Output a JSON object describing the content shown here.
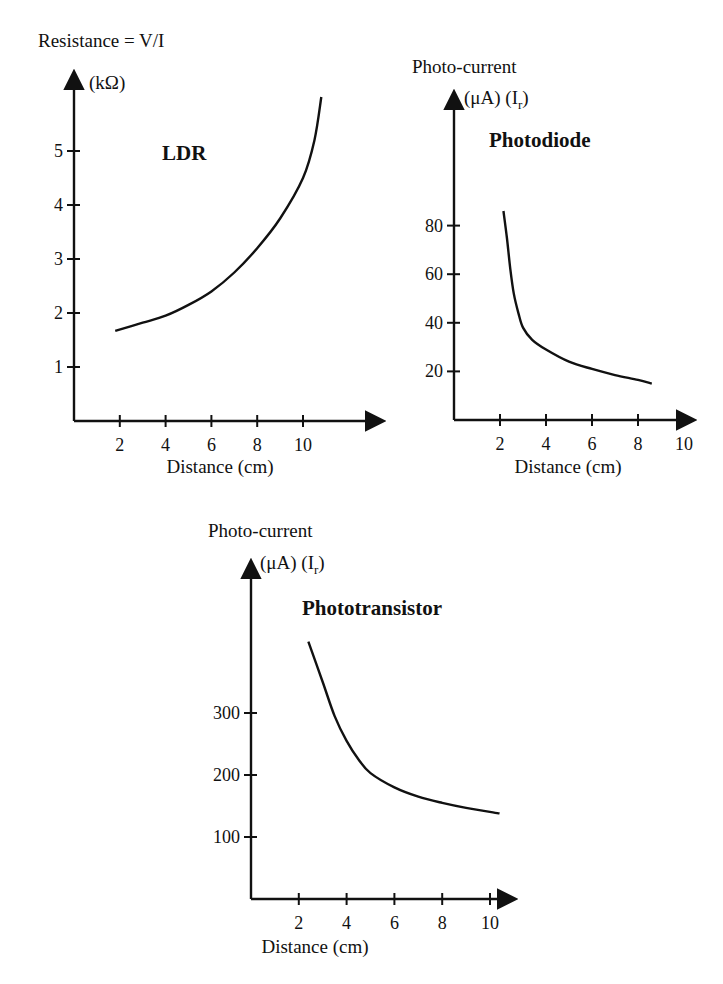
{
  "colors": {
    "ink": "#111111",
    "background": "#ffffff"
  },
  "chart_data": [
    {
      "id": "ldr",
      "type": "line",
      "title": "LDR",
      "ylabel_line1": "Resistance = V/I",
      "ylabel_line2": "(kΩ)",
      "xlabel": "Distance (cm)",
      "x_ticks": [
        2,
        4,
        6,
        8,
        10
      ],
      "y_ticks": [
        1,
        2,
        3,
        4,
        5
      ],
      "xlim": [
        0,
        12.7
      ],
      "ylim": [
        0,
        6.3
      ],
      "x": [
        1.8,
        3,
        4,
        5,
        6,
        7,
        8,
        9,
        10,
        10.5,
        10.8
      ],
      "values": [
        1.67,
        1.82,
        1.95,
        2.15,
        2.4,
        2.75,
        3.2,
        3.75,
        4.5,
        5.2,
        6.0
      ],
      "layout": {
        "ox": 74,
        "oy": 421,
        "px_per_x": 22.9,
        "px_per_y": 54.0,
        "x_end": 382,
        "y_top": 73,
        "ylabel1_xy": [
          38,
          47
        ],
        "ylabel2_xy": [
          89,
          89
        ],
        "title_xy": [
          162,
          160
        ],
        "xlabel_xy": [
          220,
          473
        ]
      }
    },
    {
      "id": "photodiode",
      "type": "line",
      "title": "Photodiode",
      "ylabel_line1": "Photo-current",
      "ylabel_line2_a": "(μA) (I",
      "ylabel_line2_sub": "r",
      "ylabel_line2_b": ")",
      "xlabel": "Distance (cm)",
      "x_ticks": [
        2,
        4,
        6,
        8,
        10
      ],
      "y_ticks": [
        20,
        40,
        60,
        80
      ],
      "xlim": [
        0,
        10.9
      ],
      "ylim": [
        0,
        100
      ],
      "x": [
        2.15,
        2.3,
        2.45,
        2.6,
        2.8,
        3.0,
        3.4,
        4.0,
        5.0,
        6.0,
        7.0,
        8.0,
        8.6
      ],
      "values": [
        86,
        75,
        62,
        52,
        44,
        38,
        33,
        29,
        24,
        21,
        18.5,
        16.5,
        15
      ],
      "layout": {
        "ox": 454,
        "oy": 420,
        "px_per_x": 23.0,
        "px_per_y": 2.43,
        "x_end": 693,
        "y_top": 93,
        "ylabel1_xy": [
          412,
          73
        ],
        "ylabel2_xy": [
          464,
          104
        ],
        "title_xy": [
          489,
          147
        ],
        "xlabel_xy": [
          568,
          473
        ]
      }
    },
    {
      "id": "phototransistor",
      "type": "line",
      "title": "Phototransistor",
      "ylabel_line1": "Photo-current",
      "ylabel_line2_a": "(μA) (I",
      "ylabel_line2_sub": "r",
      "ylabel_line2_b": ")",
      "xlabel": "Distance (cm)",
      "x_ticks": [
        2,
        4,
        6,
        8,
        10
      ],
      "y_ticks": [
        100,
        200,
        300
      ],
      "xlim": [
        0,
        11.0
      ],
      "ylim": [
        0,
        545
      ],
      "x": [
        2.4,
        3.0,
        3.5,
        4.0,
        4.5,
        5.0,
        6.0,
        7.0,
        8.0,
        9.0,
        10.4
      ],
      "values": [
        415,
        350,
        295,
        255,
        225,
        203,
        180,
        165,
        155,
        147,
        138
      ],
      "layout": {
        "ox": 251,
        "oy": 899,
        "px_per_x": 23.9,
        "px_per_y": 0.62,
        "x_end": 514,
        "y_top": 562,
        "ylabel1_xy": [
          208,
          537
        ],
        "ylabel2_xy": [
          260,
          569
        ],
        "title_xy": [
          302,
          615
        ],
        "xlabel_xy": [
          315,
          953
        ]
      }
    }
  ]
}
